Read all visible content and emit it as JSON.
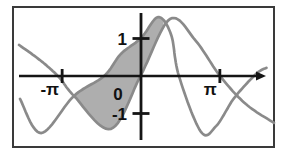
{
  "figure": {
    "border_color": "#3a3a3a",
    "background": "#ffffff",
    "axis_color": "#151515",
    "curve_color": "#8a8a8a",
    "shade_color": "#aeaeae",
    "label_color": "#111111"
  },
  "chart_data": {
    "type": "line",
    "title": "",
    "xlabel": "",
    "ylabel": "",
    "x_range": [
      -4.9,
      5.35
    ],
    "y_range": [
      -1.75,
      1.75
    ],
    "grid": false,
    "legend": false,
    "x_ticks": [
      {
        "label": "-π",
        "value": -3.1416
      },
      {
        "label": "π",
        "value": 3.1416
      }
    ],
    "y_ticks": [
      {
        "label": "1",
        "value": 1
      },
      {
        "label": "-1",
        "value": -1
      }
    ],
    "origin_label": "0",
    "series": [
      {
        "name": "curve-steep",
        "points": [
          [
            -4.82,
            -0.61
          ],
          [
            -3.98,
            -1.52
          ],
          [
            -2.67,
            -0.53
          ],
          [
            -1.47,
            0
          ],
          [
            -0.8,
            0.59
          ],
          [
            0,
            1.01
          ],
          [
            0.68,
            1.57
          ],
          [
            1.2,
            1.1
          ],
          [
            1.51,
            0
          ],
          [
            2.39,
            -1.49
          ],
          [
            3.0,
            -1.33
          ],
          [
            3.71,
            -0.59
          ],
          [
            4.58,
            0.05
          ],
          [
            5.0,
            0.22
          ]
        ]
      },
      {
        "name": "curve-wide",
        "points": [
          [
            -4.86,
            0.83
          ],
          [
            -3.98,
            0.4
          ],
          [
            -3.27,
            -0.03
          ],
          [
            -2.67,
            -0.53
          ],
          [
            -1.2,
            -1.41
          ],
          [
            0,
            0.03
          ],
          [
            1.16,
            1.52
          ],
          [
            2.19,
            0.93
          ],
          [
            3.15,
            0
          ],
          [
            4.18,
            -0.75
          ],
          [
            5.3,
            -1.25
          ]
        ]
      }
    ],
    "shaded_region": {
      "between": [
        "curve-steep",
        "curve-wide"
      ],
      "from_x": -2.67,
      "to_x": 0.92,
      "tip_point": [
        0.92,
        1.46
      ]
    }
  }
}
